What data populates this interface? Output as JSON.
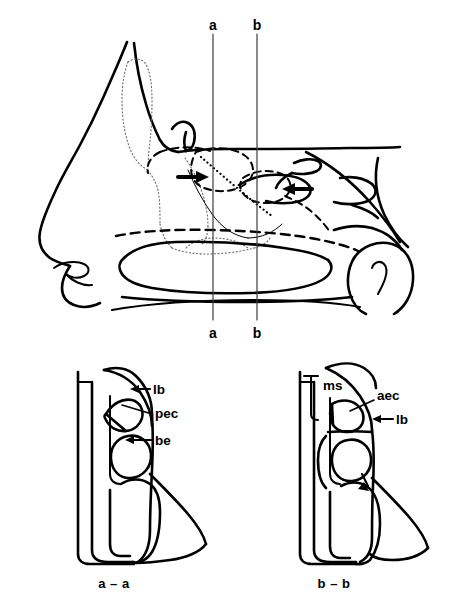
{
  "figure": {
    "background_color": "#ffffff",
    "ink_color": "#000000"
  },
  "sagittal_view": {
    "name": "lateral-nasal-wall-sagittal",
    "section_lines": [
      {
        "id": "a",
        "top_label": "a",
        "bottom_label": "a",
        "x": 213
      },
      {
        "id": "b",
        "top_label": "b",
        "bottom_label": "b",
        "x": 257
      }
    ],
    "arrows": [
      {
        "id": "arrow-anterior",
        "label": "",
        "direction": "right"
      },
      {
        "id": "arrow-posterior",
        "label": "",
        "direction": "left"
      }
    ]
  },
  "section_a": {
    "caption": "a – a",
    "annotations": [
      {
        "key": "lb",
        "text": "lb",
        "marker": "arrow"
      },
      {
        "key": "pec",
        "text": "pec",
        "marker": "leader"
      },
      {
        "key": "be",
        "text": "be",
        "marker": "arrow"
      }
    ]
  },
  "section_b": {
    "caption": "b – b",
    "annotations": [
      {
        "key": "ms",
        "text": "ms",
        "marker": "bracket"
      },
      {
        "key": "aec",
        "text": "aec",
        "marker": "leader"
      },
      {
        "key": "lb",
        "text": "lb",
        "marker": "arrow"
      }
    ]
  }
}
